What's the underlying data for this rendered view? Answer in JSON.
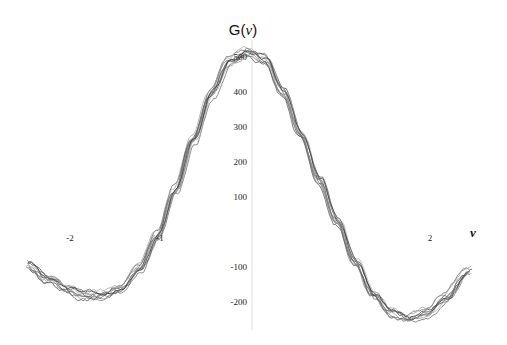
{
  "chart_data": {
    "type": "line",
    "title": "G(ν)",
    "title_prefix": "G(",
    "title_symbol": "ν",
    "title_suffix": ")",
    "xlabel": "ν",
    "ylabel": "G(ν)",
    "xlim": [
      -2.5,
      2.6
    ],
    "ylim": [
      -270,
      530
    ],
    "x_ticks": [
      {
        "value": -2,
        "label": "-2"
      },
      {
        "value": -1,
        "label": "-1"
      },
      {
        "value": 2,
        "label": "2"
      }
    ],
    "y_ticks": [
      {
        "value": 500,
        "label": "500"
      },
      {
        "value": 400,
        "label": "400"
      },
      {
        "value": 300,
        "label": "300"
      },
      {
        "value": 200,
        "label": "200"
      },
      {
        "value": 100,
        "label": "100"
      },
      {
        "value": -100,
        "label": "-100"
      },
      {
        "value": -200,
        "label": "-200"
      }
    ],
    "grid": false,
    "legend": "none",
    "series_count": 10,
    "noise_amplitude": 14,
    "mean_curve": {
      "x": [
        -2.45,
        -2.2,
        -2.0,
        -1.8,
        -1.6,
        -1.4,
        -1.2,
        -1.0,
        -0.8,
        -0.6,
        -0.4,
        -0.2,
        0.0,
        0.2,
        0.4,
        0.6,
        0.8,
        1.0,
        1.2,
        1.4,
        1.6,
        1.8,
        2.0,
        2.2,
        2.45
      ],
      "y": [
        -95,
        -137,
        -166,
        -183,
        -180,
        -160,
        -103,
        -11,
        120,
        263,
        392,
        486,
        515,
        492,
        400,
        277,
        149,
        29,
        -86,
        -180,
        -232,
        -246,
        -229,
        -189,
        -114
      ]
    },
    "series_colors": [
      "#3a3a3a",
      "#555555",
      "#6e6e6e",
      "#888888",
      "#9a9a9a",
      "#444444",
      "#777777",
      "#5f5f5f",
      "#a8a8a8",
      "#2e2e2e"
    ]
  }
}
